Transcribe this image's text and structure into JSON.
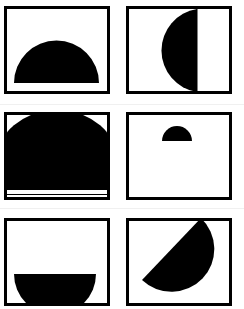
{
  "figure": {
    "colors": {
      "shape": "#000000",
      "frame": "#000000",
      "background": "#ffffff",
      "divider": "#f0f0f0"
    },
    "panels": [
      {
        "id": "top-left",
        "shape": "semicircle",
        "orientation": "flat-side-down",
        "position": "centered-bottom",
        "size": "medium"
      },
      {
        "id": "top-right",
        "shape": "semicircle",
        "orientation": "flat-side-right",
        "position": "center",
        "size": "large"
      },
      {
        "id": "middle-left",
        "shape": "semicircle",
        "orientation": "flat-side-down",
        "position": "fills-frame",
        "size": "oversized"
      },
      {
        "id": "middle-right",
        "shape": "semicircle",
        "orientation": "flat-side-down",
        "position": "upper-center",
        "size": "small"
      },
      {
        "id": "bottom-left",
        "shape": "semicircle",
        "orientation": "flat-side-up",
        "position": "bottom",
        "size": "medium"
      },
      {
        "id": "bottom-right",
        "shape": "semicircle",
        "orientation": "flat-side-up-left-diagonal",
        "position": "center",
        "size": "large"
      }
    ]
  }
}
